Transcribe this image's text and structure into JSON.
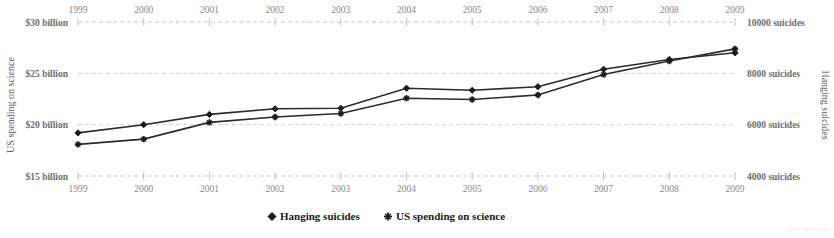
{
  "chart_data": {
    "type": "line",
    "title": "",
    "x": [
      1999,
      2000,
      2001,
      2002,
      2003,
      2004,
      2005,
      2006,
      2007,
      2008,
      2009
    ],
    "categories": [
      "1999",
      "2000",
      "2001",
      "2002",
      "2003",
      "2004",
      "2005",
      "2006",
      "2007",
      "2008",
      "2009"
    ],
    "series": [
      {
        "name": "Hanging suicides",
        "axis": "right",
        "unit": "suicides",
        "marker": "diamond",
        "color": "#1c1c1c",
        "values": [
          5680,
          6000,
          6400,
          6620,
          6640,
          7420,
          7340,
          7480,
          8160,
          8540,
          8800
        ]
      },
      {
        "name": "US spending on science",
        "axis": "left",
        "unit": "billion USD",
        "marker": "plus",
        "color": "#1c1c1c",
        "values": [
          18.08,
          18.59,
          20.22,
          20.75,
          21.09,
          22.58,
          22.45,
          22.89,
          24.88,
          26.2,
          27.38
        ]
      }
    ],
    "xlabel": "",
    "ylabel": "US spending on science",
    "y2label": "Hanging suicides",
    "ylim": [
      15,
      30
    ],
    "y2lim": [
      4000,
      10000
    ],
    "yticks": [
      15,
      20,
      25,
      30
    ],
    "y2ticks": [
      4000,
      6000,
      8000,
      10000
    ],
    "ytick_labels": [
      "$15 billion",
      "$20 billion",
      "$25 billion",
      "$30 billion"
    ],
    "y2tick_labels": [
      "4000 suicides",
      "6000 suicides",
      "8000 suicides",
      "10000 suicides"
    ],
    "grid": true,
    "legend_position": "bottom",
    "x_axis_top_labels": [
      "1999",
      "2000",
      "2001",
      "2002",
      "2003",
      "2004",
      "2005",
      "2006",
      "2007",
      "2008",
      "2009"
    ],
    "x_axis_bottom_labels": [
      "1999",
      "2000",
      "2001",
      "2002",
      "2003",
      "2004",
      "2005",
      "2006",
      "2007",
      "2008",
      "2009"
    ]
  },
  "legend": {
    "items": [
      {
        "label": "Hanging suicides",
        "marker": "diamond"
      },
      {
        "label": "US spending on science",
        "marker": "plus"
      }
    ]
  },
  "axes": {
    "left_title": "US spending on science",
    "right_title": "Hanging suicides",
    "left_labels": [
      "$30 billion",
      "$25 billion",
      "$20 billion",
      "$15 billion"
    ],
    "right_labels": [
      "10000 suicides",
      "8000 suicides",
      "6000 suicides",
      "4000 suicides"
    ]
  },
  "watermark": {
    "text": "tylervigen.com"
  }
}
